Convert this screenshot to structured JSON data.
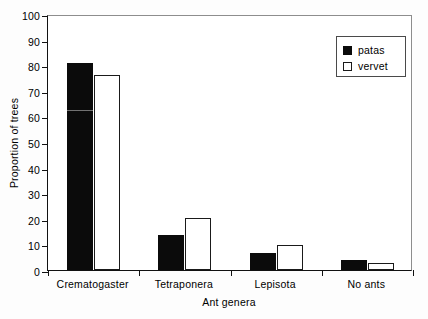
{
  "chart_data": {
    "type": "bar",
    "title": "",
    "xlabel": "Ant genera",
    "ylabel": "Proportion of trees",
    "categories": [
      "Crematogaster",
      "Tetraponera",
      "Lepisota",
      "No ants"
    ],
    "series": [
      {
        "name": "patas",
        "values": [
          81,
          13.5,
          6.5,
          4
        ],
        "color": "#0b0b0b",
        "fill": "solid"
      },
      {
        "name": "vervet",
        "values": [
          76,
          20.5,
          9.8,
          2.8
        ],
        "color": "#ffffff",
        "fill": "open"
      }
    ],
    "ylim": [
      0,
      100
    ],
    "yticks": [
      0,
      10,
      20,
      30,
      40,
      50,
      60,
      70,
      80,
      90,
      100
    ],
    "ytick_labels": [
      "0",
      "10",
      "20",
      "30",
      "40",
      "50",
      "60",
      "70",
      "80",
      "90",
      "100"
    ],
    "grid": false,
    "legend_position": "top-right",
    "legend_entries": [
      "patas",
      "vervet"
    ]
  },
  "axes": {
    "y_title": "Proportion of trees",
    "x_title": "Ant genera"
  },
  "legend": {
    "items": [
      {
        "label": "patas"
      },
      {
        "label": "vervet"
      }
    ]
  }
}
